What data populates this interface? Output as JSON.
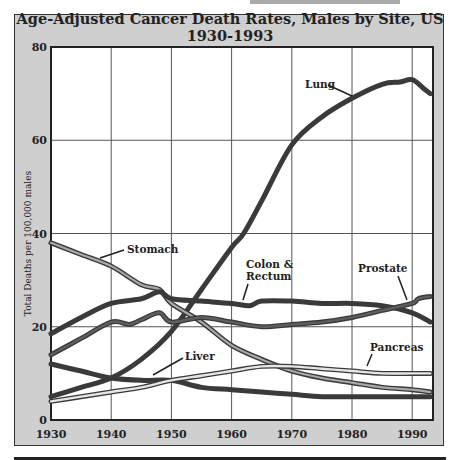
{
  "header_fragment": "MALES",
  "chart_data": {
    "type": "line",
    "title": "Age-Adjusted Cancer Death Rates, Males by Site, US 1930-1993",
    "xlabel": "",
    "ylabel": "Total Deaths per 100,000 males",
    "xlim": [
      1930,
      1993
    ],
    "ylim": [
      0,
      80
    ],
    "x_ticks": [
      1930,
      1940,
      1950,
      1960,
      1970,
      1980,
      1990
    ],
    "y_ticks": [
      0,
      20,
      40,
      60,
      80
    ],
    "grid": true,
    "legend_position": "inline labels",
    "series": [
      {
        "name": "Lung",
        "style": "dark",
        "x": [
          1930,
          1935,
          1940,
          1945,
          1950,
          1955,
          1960,
          1962,
          1965,
          1970,
          1975,
          1980,
          1985,
          1988,
          1990,
          1992,
          1993
        ],
        "values": [
          5,
          7,
          9,
          13,
          19,
          28,
          37,
          40,
          47,
          59,
          65,
          69,
          72,
          72.5,
          73,
          71,
          70
        ]
      },
      {
        "name": "Stomach",
        "style": "outlined",
        "x": [
          1930,
          1935,
          1940,
          1945,
          1948,
          1950,
          1955,
          1960,
          1965,
          1970,
          1975,
          1980,
          1985,
          1990,
          1993
        ],
        "values": [
          38,
          35.5,
          33,
          29,
          28,
          25,
          21,
          16,
          13,
          10.5,
          9,
          8,
          7,
          6.5,
          6
        ]
      },
      {
        "name": "Colon & Rectum",
        "style": "dark",
        "x": [
          1930,
          1935,
          1940,
          1945,
          1948,
          1950,
          1955,
          1960,
          1963,
          1965,
          1970,
          1975,
          1980,
          1985,
          1990,
          1993
        ],
        "values": [
          18.5,
          22,
          25,
          26,
          27.5,
          26,
          25.5,
          25,
          24.5,
          25.5,
          25.5,
          25,
          25,
          24.5,
          23,
          21
        ]
      },
      {
        "name": "Prostate",
        "style": "outlined-dark",
        "x": [
          1930,
          1935,
          1940,
          1943,
          1945,
          1948,
          1950,
          1955,
          1960,
          1965,
          1970,
          1975,
          1980,
          1985,
          1990,
          1991,
          1993
        ],
        "values": [
          14,
          17.5,
          21,
          20.5,
          21.5,
          23,
          21,
          22,
          21,
          20,
          20.5,
          21,
          22,
          23.5,
          25,
          26,
          26.5
        ]
      },
      {
        "name": "Liver",
        "style": "dark",
        "x": [
          1930,
          1935,
          1940,
          1945,
          1950,
          1955,
          1960,
          1965,
          1970,
          1975,
          1980,
          1985,
          1990,
          1993
        ],
        "values": [
          12,
          10.5,
          9,
          8.5,
          8.5,
          7,
          6.5,
          6,
          5.5,
          5,
          5,
          5,
          5,
          5
        ]
      },
      {
        "name": "Pancreas",
        "style": "outlined-light",
        "x": [
          1930,
          1935,
          1940,
          1945,
          1950,
          1955,
          1960,
          1965,
          1970,
          1975,
          1980,
          1985,
          1990,
          1993
        ],
        "values": [
          4,
          5,
          6,
          7,
          8.5,
          9.5,
          10.5,
          11.5,
          11.5,
          11,
          10.5,
          10,
          10,
          10
        ]
      }
    ],
    "annotations": [
      "Lung",
      "Stomach",
      "Colon &",
      "Rectum",
      "Prostate",
      "Liver",
      "Pancreas"
    ]
  }
}
